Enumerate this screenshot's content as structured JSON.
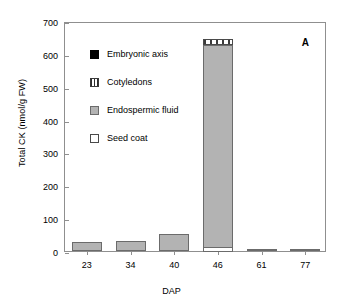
{
  "panel_label": "A",
  "axes": {
    "xlabel": "DAP",
    "ylabel": "Total CK (nmol/g FW)",
    "yticks": [
      "0",
      "100",
      "200",
      "300",
      "400",
      "500",
      "600",
      "700"
    ],
    "xticks": [
      "23",
      "34",
      "40",
      "46",
      "61",
      "77"
    ]
  },
  "legend": {
    "items": [
      {
        "label": "Embryonic axis",
        "swatch": "embryo",
        "color": "#000000"
      },
      {
        "label": "Cotyledons",
        "swatch": "cotyledon",
        "color": "#ffffff"
      },
      {
        "label": "Endospermic fluid",
        "swatch": "endosperm",
        "color": "#b3b3b3"
      },
      {
        "label": "Seed coat",
        "swatch": "seedcoat",
        "color": "#ffffff"
      }
    ]
  },
  "chart_data": {
    "type": "bar",
    "title": "",
    "subtitle": "",
    "xlabel": "DAP",
    "ylabel": "Total CK (nmol/g FW)",
    "ylim": [
      0,
      700
    ],
    "ytick_step": 100,
    "grid": false,
    "stacked": true,
    "legend_position": "inside-upper-left",
    "annotations": [
      "A"
    ],
    "categories": [
      "23",
      "34",
      "40",
      "46",
      "61",
      "77"
    ],
    "series": [
      {
        "name": "Seed coat",
        "values": [
          0,
          0,
          0,
          14,
          7,
          4
        ]
      },
      {
        "name": "Endospermic fluid",
        "values": [
          27,
          29,
          52,
          620,
          0,
          0
        ]
      },
      {
        "name": "Cotyledons",
        "values": [
          0,
          0,
          0,
          18,
          0,
          0
        ]
      },
      {
        "name": "Embryonic axis",
        "values": [
          0,
          0,
          0,
          0,
          0,
          0
        ]
      }
    ],
    "totals": [
      27,
      29,
      52,
      652,
      7,
      4
    ]
  }
}
